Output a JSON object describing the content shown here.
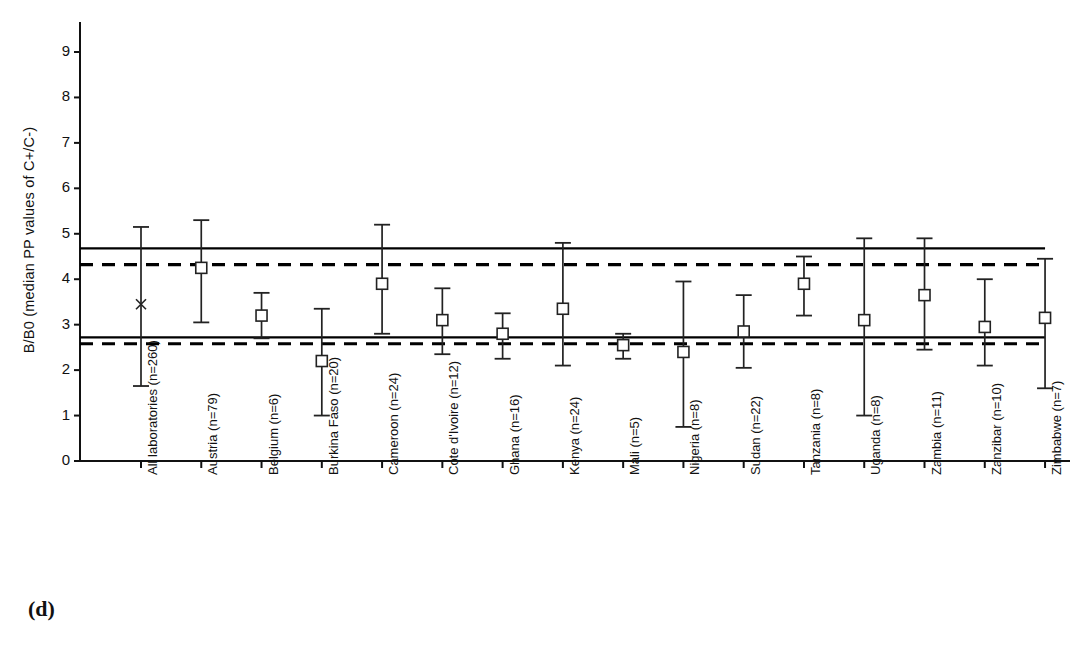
{
  "panel": {
    "letter": "(d)"
  },
  "chart_data": {
    "type": "scatter",
    "title": "",
    "subtitle": "",
    "xlabel": "",
    "ylabel": "B/B0 (median PP values of C+/C-)",
    "ylim": [
      0,
      9.4
    ],
    "yticks": [
      0,
      1,
      2,
      3,
      4,
      5,
      6,
      7,
      8,
      9
    ],
    "ytick_labels": [
      "0",
      "1",
      "2",
      "3",
      "4",
      "5",
      "6",
      "7",
      "8",
      "9"
    ],
    "grid": false,
    "legend": "none",
    "marker_styles": {
      "all_laboratories": "x-cross",
      "countries": "open-square"
    },
    "categories": [
      "All laboratories (n=260)",
      "Austria (n=79)",
      "Belgium (n=6)",
      "Burkina Faso (n=20)",
      "Cameroon (n=24)",
      "Cote d'Ivoire (n=12)",
      "Ghana (n=16)",
      "Kenya (n=24)",
      "Mali (n=5)",
      "Nigeria (n=8)",
      "Sudan (n=22)",
      "Tanzania (n=8)",
      "Uganda (n=8)",
      "Zambia (n=11)",
      "Zanzibar (n=10)",
      "Zimbabwe (n=7)"
    ],
    "values": [
      3.45,
      4.25,
      3.2,
      2.2,
      3.9,
      3.1,
      2.8,
      3.35,
      2.55,
      2.4,
      2.85,
      3.9,
      3.1,
      3.65,
      2.95,
      3.15
    ],
    "error_low": [
      1.65,
      3.05,
      2.7,
      1.0,
      2.8,
      2.35,
      2.25,
      2.1,
      2.25,
      0.75,
      2.05,
      3.2,
      1.0,
      2.45,
      2.1,
      1.6
    ],
    "error_high": [
      5.15,
      5.3,
      3.7,
      3.35,
      5.2,
      3.8,
      3.25,
      4.8,
      2.8,
      3.95,
      3.65,
      4.5,
      4.9,
      4.9,
      4.0,
      4.45
    ],
    "reference_lines": [
      {
        "name": "upper-solid",
        "value": 4.68,
        "style": "solid"
      },
      {
        "name": "upper-dashed",
        "value": 4.32,
        "style": "dashed"
      },
      {
        "name": "lower-solid",
        "value": 2.72,
        "style": "solid"
      },
      {
        "name": "lower-dashed",
        "value": 2.58,
        "style": "dashed"
      }
    ],
    "colors": {
      "axis": "#111111",
      "marker": "#222222",
      "errorbar": "#222222",
      "reference": "#000000",
      "background": "#ffffff"
    }
  }
}
